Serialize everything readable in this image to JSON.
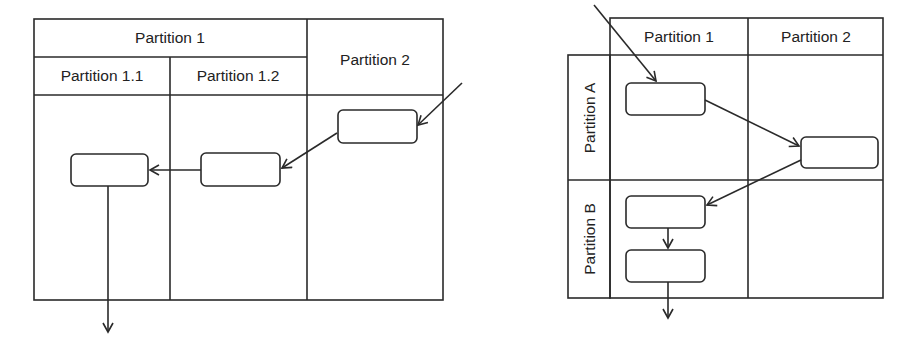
{
  "left_diagram": {
    "type": "swimlane-vertical-nested",
    "headers": {
      "partition_1": "Partition 1",
      "partition_1_1": "Partition 1.1",
      "partition_1_2": "Partition 1.2",
      "partition_2": "Partition 2"
    },
    "nodes": [
      {
        "id": "L1",
        "lane": "Partition 2",
        "label": ""
      },
      {
        "id": "L2",
        "lane": "Partition 1.2",
        "label": ""
      },
      {
        "id": "L3",
        "lane": "Partition 1.1",
        "label": ""
      }
    ],
    "edges": [
      {
        "from": "external",
        "to": "L1"
      },
      {
        "from": "L1",
        "to": "L2"
      },
      {
        "from": "L2",
        "to": "L3"
      },
      {
        "from": "L3",
        "to": "external"
      }
    ]
  },
  "right_diagram": {
    "type": "swimlane-grid",
    "column_headers": {
      "partition_1": "Partition 1",
      "partition_2": "Partition 2"
    },
    "row_headers": {
      "partition_a": "Partition A",
      "partition_b": "Partition B"
    },
    "nodes": [
      {
        "id": "R1",
        "cell": "A/1",
        "label": ""
      },
      {
        "id": "R2",
        "cell": "A/2",
        "label": ""
      },
      {
        "id": "R3",
        "cell": "B/1",
        "label": ""
      },
      {
        "id": "R4",
        "cell": "B/1",
        "label": ""
      }
    ],
    "edges": [
      {
        "from": "external",
        "to": "R1"
      },
      {
        "from": "R1",
        "to": "R2"
      },
      {
        "from": "R2",
        "to": "R3"
      },
      {
        "from": "R3",
        "to": "R4"
      },
      {
        "from": "R4",
        "to": "external"
      }
    ]
  },
  "colors": {
    "line": "#2a2a2a",
    "background": "#ffffff"
  }
}
